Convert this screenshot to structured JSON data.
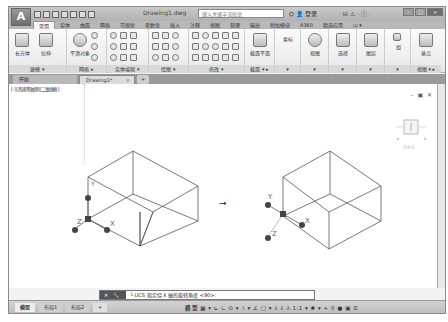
{
  "app": {
    "logo": "A",
    "document_title": "Drawing1.dwg",
    "search_placeholder": "键入关键字或短语",
    "login_label": "登录",
    "title_tools": "· ⊟ ⚠ · ⓘ ·",
    "window_controls": [
      "–",
      "□",
      "×"
    ]
  },
  "ribbon": {
    "tabs": [
      {
        "label": "常用",
        "active": true
      },
      {
        "label": "实体"
      },
      {
        "label": "曲面"
      },
      {
        "label": "网格"
      },
      {
        "label": "可视化"
      },
      {
        "label": "参数化"
      },
      {
        "label": "插入"
      },
      {
        "label": "注释"
      },
      {
        "label": "视图"
      },
      {
        "label": "管理"
      },
      {
        "label": "输出"
      },
      {
        "label": "附加模块"
      },
      {
        "label": "A360"
      },
      {
        "label": "精选应用"
      },
      {
        "label": "▭ ▾"
      }
    ],
    "panels": [
      {
        "name": "modeling",
        "label": "建模 ▾",
        "buttons": [
          "长方体",
          "拉伸"
        ]
      },
      {
        "name": "mesh",
        "label": "网格 ▸",
        "buttons": [
          "平滑对象"
        ]
      },
      {
        "name": "solid-edit",
        "label": "实体编辑 ▾"
      },
      {
        "name": "draw",
        "label": "绘图 ▾"
      },
      {
        "name": "modify",
        "label": "修改 ▾"
      },
      {
        "name": "section",
        "label": "截面 ▾ ▸",
        "buttons": [
          "截面平面"
        ]
      },
      {
        "name": "coordinates",
        "label": "▾",
        "buttons": [
          "坐标"
        ]
      },
      {
        "name": "view-style",
        "label": "▾",
        "buttons": [
          "视图"
        ]
      },
      {
        "name": "selection",
        "label": "▾",
        "buttons": [
          "选择"
        ]
      },
      {
        "name": "layers",
        "label": "▾",
        "buttons": [
          "图层"
        ]
      },
      {
        "name": "groups",
        "label": "▾",
        "buttons": [
          "组"
        ]
      },
      {
        "name": "view",
        "label": "视图 ▾ ▸",
        "buttons": [
          "基点"
        ]
      }
    ]
  },
  "file_tabs": {
    "start": "开始",
    "drawing": "Drawing1*",
    "close": "×",
    "add": "+"
  },
  "viewport": {
    "label": "[-][西南等轴测][二维线框]",
    "controls": "– ▣ ✕",
    "viewcube_label": "未命名",
    "arrow": "→",
    "axis_labels": {
      "x": "X",
      "y": "Y",
      "z": "Z"
    }
  },
  "command_line": {
    "close_btn": "✕",
    "settings_btn": "🔧",
    "prompt_icon": "└",
    "text": "UCS 指定绕 X 轴的旋转角度 <90>:"
  },
  "status_bar": {
    "layout_tabs": [
      "模型",
      "布局1",
      "布局2",
      "+"
    ],
    "model_label": "模型",
    "tools": "▦ ▾ ⊾ ∟ ⊙ ▾ ∖ ▾ ∠ ▢ ▾ ⅄ ⅄ ⅄ 1:1 ▾ ✱ ▾ + ⚲ ● ▣ ☰"
  },
  "colors": {
    "title_bar": "#b8b8b8",
    "ribbon_bg": "#f0f0f0",
    "canvas_bg": "#ffffff",
    "lines": "#555555",
    "ucs_marker": "#444444"
  }
}
